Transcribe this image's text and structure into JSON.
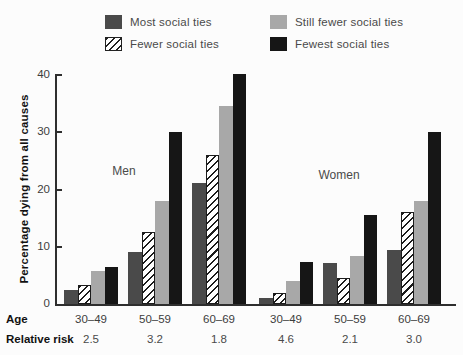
{
  "legend": {
    "items": [
      {
        "label": "Most social ties",
        "style": "solid",
        "color": "#4a4a4a"
      },
      {
        "label": "Fewer social ties",
        "style": "hatched",
        "color": "#1c1c1c"
      },
      {
        "label": "Still fewer social ties",
        "style": "solid",
        "color": "#a8a8a8"
      },
      {
        "label": "Fewest social ties",
        "style": "solid",
        "color": "#161616"
      }
    ]
  },
  "chart_data": {
    "type": "bar",
    "title": "",
    "ylabel": "Percentage dying from all causes",
    "ylim": [
      0,
      40
    ],
    "yticks": [
      0,
      10,
      20,
      30,
      40
    ],
    "grid": false,
    "legend_position": "top",
    "categories": [
      "30–49",
      "50–59",
      "60–69",
      "30–49",
      "50–59",
      "60–69"
    ],
    "panel_labels": [
      {
        "text": "Men"
      },
      {
        "text": "Women"
      }
    ],
    "series": [
      {
        "name": "Most social ties",
        "values": [
          2.5,
          9,
          21,
          1,
          7.2,
          9.4
        ]
      },
      {
        "name": "Fewer social ties",
        "values": [
          3.3,
          12.5,
          26,
          2,
          4.5,
          16
        ]
      },
      {
        "name": "Still fewer social ties",
        "values": [
          5.7,
          18,
          34.5,
          4,
          8.4,
          18
        ]
      },
      {
        "name": "Fewest social ties",
        "values": [
          6.5,
          30,
          40,
          7.3,
          15.5,
          30
        ]
      }
    ],
    "x_axis_rows": [
      {
        "label": "Age",
        "values": [
          "30–49",
          "50–59",
          "60–69",
          "30–49",
          "50–59",
          "60–69"
        ]
      },
      {
        "label": "Relative risk",
        "values": [
          "2.5",
          "3.2",
          "1.8",
          "4.6",
          "2.1",
          "3.0"
        ]
      }
    ]
  }
}
